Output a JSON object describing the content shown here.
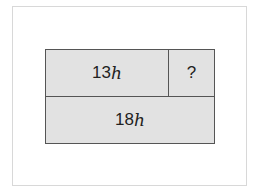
{
  "diagram": {
    "type": "tape-diagram",
    "top_row": [
      {
        "coef": "13",
        "var": "h"
      },
      {
        "label": "?"
      }
    ],
    "bottom_row": [
      {
        "coef": "18",
        "var": "h"
      }
    ]
  }
}
